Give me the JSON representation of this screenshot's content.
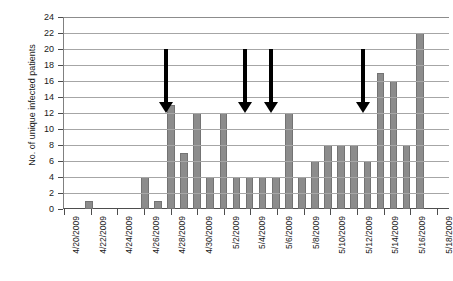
{
  "chart_data": {
    "type": "bar",
    "title": "",
    "xlabel": "",
    "ylabel": "No. of unique infected patients",
    "ylim": [
      0,
      24
    ],
    "ytick_step": 2,
    "yticks": [
      0,
      2,
      4,
      6,
      8,
      10,
      12,
      14,
      16,
      18,
      20,
      22,
      24
    ],
    "grid": true,
    "legend": "none",
    "bar_color": "#8c8c8c",
    "bar_border_color": "#737373",
    "xtick_labels": [
      "4/20/2009",
      "4/22/2009",
      "4/24/2009",
      "4/26/2009",
      "4/28/2009",
      "4/30/2009",
      "5/2/2009",
      "5/4/2009",
      "5/6/2009",
      "5/8/2009",
      "5/10/2009",
      "5/12/2009",
      "5/14/2009",
      "5/16/2009",
      "5/18/2009"
    ],
    "xtick_label_indices": [
      0,
      2,
      4,
      6,
      8,
      10,
      12,
      14,
      16,
      18,
      20,
      22,
      24,
      26,
      28
    ],
    "categories": [
      "4/20/2009",
      "4/21/2009",
      "4/22/2009",
      "4/23/2009",
      "4/24/2009",
      "4/25/2009",
      "4/26/2009",
      "4/27/2009",
      "4/28/2009",
      "4/29/2009",
      "4/30/2009",
      "5/1/2009",
      "5/2/2009",
      "5/3/2009",
      "5/4/2009",
      "5/5/2009",
      "5/6/2009",
      "5/7/2009",
      "5/8/2009",
      "5/9/2009",
      "5/10/2009",
      "5/11/2009",
      "5/12/2009",
      "5/13/2009",
      "5/14/2009",
      "5/15/2009",
      "5/16/2009",
      "5/17/2009",
      "5/18/2009"
    ],
    "values": [
      0,
      0,
      1,
      0,
      0,
      0,
      0,
      4,
      1,
      13,
      7,
      12,
      4,
      12,
      4,
      4,
      4,
      4,
      12,
      4,
      6,
      8,
      8,
      8,
      6,
      17,
      16,
      8,
      22
    ],
    "values_full": [
      {
        "date": "4/20/2009",
        "value": 0
      },
      {
        "date": "4/21/2009",
        "value": 0
      },
      {
        "date": "4/22/2009",
        "value": 1
      },
      {
        "date": "4/23/2009",
        "value": 0
      },
      {
        "date": "4/24/2009",
        "value": 0
      },
      {
        "date": "4/25/2009",
        "value": 0
      },
      {
        "date": "4/26/2009",
        "value": 0
      },
      {
        "date": "4/27/2009",
        "value": 4
      },
      {
        "date": "4/28/2009",
        "value": 1
      },
      {
        "date": "4/29/2009",
        "value": 13
      },
      {
        "date": "4/30/2009",
        "value": 7
      },
      {
        "date": "5/1/2009",
        "value": 12
      },
      {
        "date": "5/2/2009",
        "value": 4
      },
      {
        "date": "5/3/2009",
        "value": 12
      },
      {
        "date": "5/4/2009",
        "value": 4
      },
      {
        "date": "5/5/2009",
        "value": 4
      },
      {
        "date": "5/6/2009",
        "value": 4
      },
      {
        "date": "5/7/2009",
        "value": 4
      },
      {
        "date": "5/8/2009",
        "value": 12
      },
      {
        "date": "5/9/2009",
        "value": 4
      },
      {
        "date": "5/10/2009",
        "value": 6
      },
      {
        "date": "5/11/2009",
        "value": 8
      },
      {
        "date": "5/12/2009",
        "value": 8
      },
      {
        "date": "5/13/2009",
        "value": 8
      },
      {
        "date": "5/14/2009",
        "value": 6
      },
      {
        "date": "5/15/2009",
        "value": 17
      },
      {
        "date": "5/16/2009",
        "value": 16
      },
      {
        "date": "5/17/2009",
        "value": 8
      },
      {
        "date": "5/18/2009",
        "value": 22
      }
    ],
    "bars_layout": [
      {
        "label": "4/22/2009",
        "value": 1,
        "left_pct": 5.5
      },
      {
        "label": "4/27/2009",
        "value": 4,
        "left_pct": 20.0
      },
      {
        "label": "4/28/2009",
        "value": 1,
        "left_pct": 23.4
      },
      {
        "label": "4/29/2009",
        "value": 13,
        "left_pct": 26.8
      },
      {
        "label": "4/30/2009",
        "value": 7,
        "left_pct": 30.2
      },
      {
        "label": "5/1/2009",
        "value": 12,
        "left_pct": 33.6
      },
      {
        "label": "5/2/2009",
        "value": 4,
        "left_pct": 37.0
      },
      {
        "label": "5/3/2009",
        "value": 12,
        "left_pct": 40.4
      },
      {
        "label": "5/4/2009",
        "value": 4,
        "left_pct": 43.8
      },
      {
        "label": "5/5/2009",
        "value": 4,
        "left_pct": 47.2
      },
      {
        "label": "5/6/2009",
        "value": 4,
        "left_pct": 50.6
      },
      {
        "label": "5/7/2009",
        "value": 4,
        "left_pct": 54.0
      },
      {
        "label": "5/8/2009",
        "value": 12,
        "left_pct": 57.4
      },
      {
        "label": "5/9/2009",
        "value": 4,
        "left_pct": 60.8
      },
      {
        "label": "5/10/2009",
        "value": 6,
        "left_pct": 64.2
      },
      {
        "label": "5/11/2009",
        "value": 8,
        "left_pct": 67.6
      },
      {
        "label": "5/12/2009",
        "value": 8,
        "left_pct": 71.0
      },
      {
        "label": "5/13/2009",
        "value": 8,
        "left_pct": 74.4
      },
      {
        "label": "5/14/2009",
        "value": 6,
        "left_pct": 77.8
      },
      {
        "label": "5/15/2009",
        "value": 17,
        "left_pct": 81.2
      },
      {
        "label": "5/16/2009",
        "value": 16,
        "left_pct": 84.6
      },
      {
        "label": "5/17/2009",
        "value": 8,
        "left_pct": 88.0
      },
      {
        "label": "5/18/2009",
        "value": 22,
        "left_pct": 91.4
      }
    ],
    "annotations": [
      {
        "type": "arrow",
        "direction": "down",
        "from_value": 20,
        "to_value": 12,
        "x_pct": 26.7
      },
      {
        "type": "arrow",
        "direction": "down",
        "from_value": 20,
        "to_value": 12,
        "x_pct": 47.2
      },
      {
        "type": "arrow",
        "direction": "down",
        "from_value": 20,
        "to_value": 12,
        "x_pct": 54.0
      },
      {
        "type": "arrow",
        "direction": "down",
        "from_value": 20,
        "to_value": 12,
        "x_pct": 77.8
      }
    ]
  }
}
